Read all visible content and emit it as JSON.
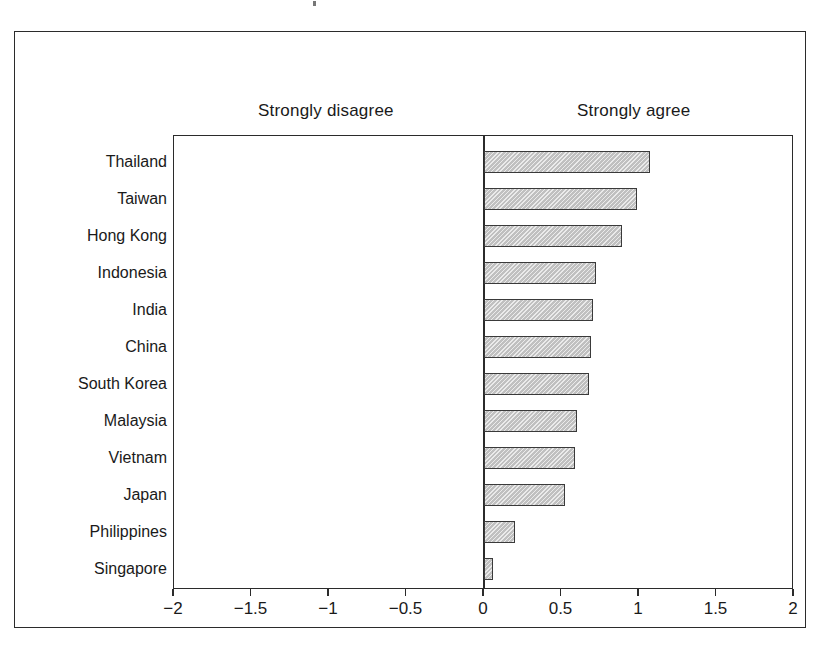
{
  "chart_data": {
    "type": "bar",
    "orientation": "horizontal",
    "title": "",
    "subtitle": "",
    "xlabel": "",
    "ylabel": "",
    "xlim": [
      -2,
      2
    ],
    "xticks": [
      -2,
      -1.5,
      -1,
      -0.5,
      0,
      0.5,
      1,
      1.5,
      2
    ],
    "xtick_labels": [
      "−2",
      "−1.5",
      "−1",
      "−0.5",
      "0",
      "0.5",
      "1",
      "1.5",
      "2"
    ],
    "grid": false,
    "legend": null,
    "annotations": [
      {
        "text": "Strongly disagree",
        "side": "left"
      },
      {
        "text": "Strongly agree",
        "side": "right"
      }
    ],
    "categories": [
      "Thailand",
      "Taiwan",
      "Hong Kong",
      "Indonesia",
      "India",
      "China",
      "South Korea",
      "Malaysia",
      "Vietnam",
      "Japan",
      "Philippines",
      "Singapore"
    ],
    "values": [
      1.07,
      0.99,
      0.89,
      0.72,
      0.7,
      0.69,
      0.68,
      0.6,
      0.59,
      0.52,
      0.2,
      0.06
    ],
    "bar_fill_color": "#d2d2d2",
    "bar_edge_color": "#3a3a3a",
    "axis_color": "#2b2b2b",
    "background_color": "#ffffff"
  }
}
